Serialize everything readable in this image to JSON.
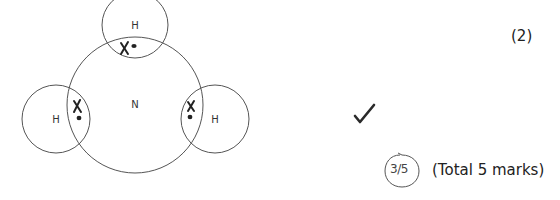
{
  "diagram": {
    "central_atom": "N",
    "atoms": [
      {
        "position": "top",
        "label": "H"
      },
      {
        "position": "left",
        "label": "H"
      },
      {
        "position": "right",
        "label": "H"
      }
    ],
    "electron_symbols": {
      "cross": "X",
      "dot": "•"
    }
  },
  "question": {
    "marks_label": "(2)",
    "total_label": "(Total 5 marks)"
  },
  "marking": {
    "tick_icon": "checkmark-icon",
    "score": "3/5",
    "score_numerator": "3",
    "score_denominator": "5"
  }
}
